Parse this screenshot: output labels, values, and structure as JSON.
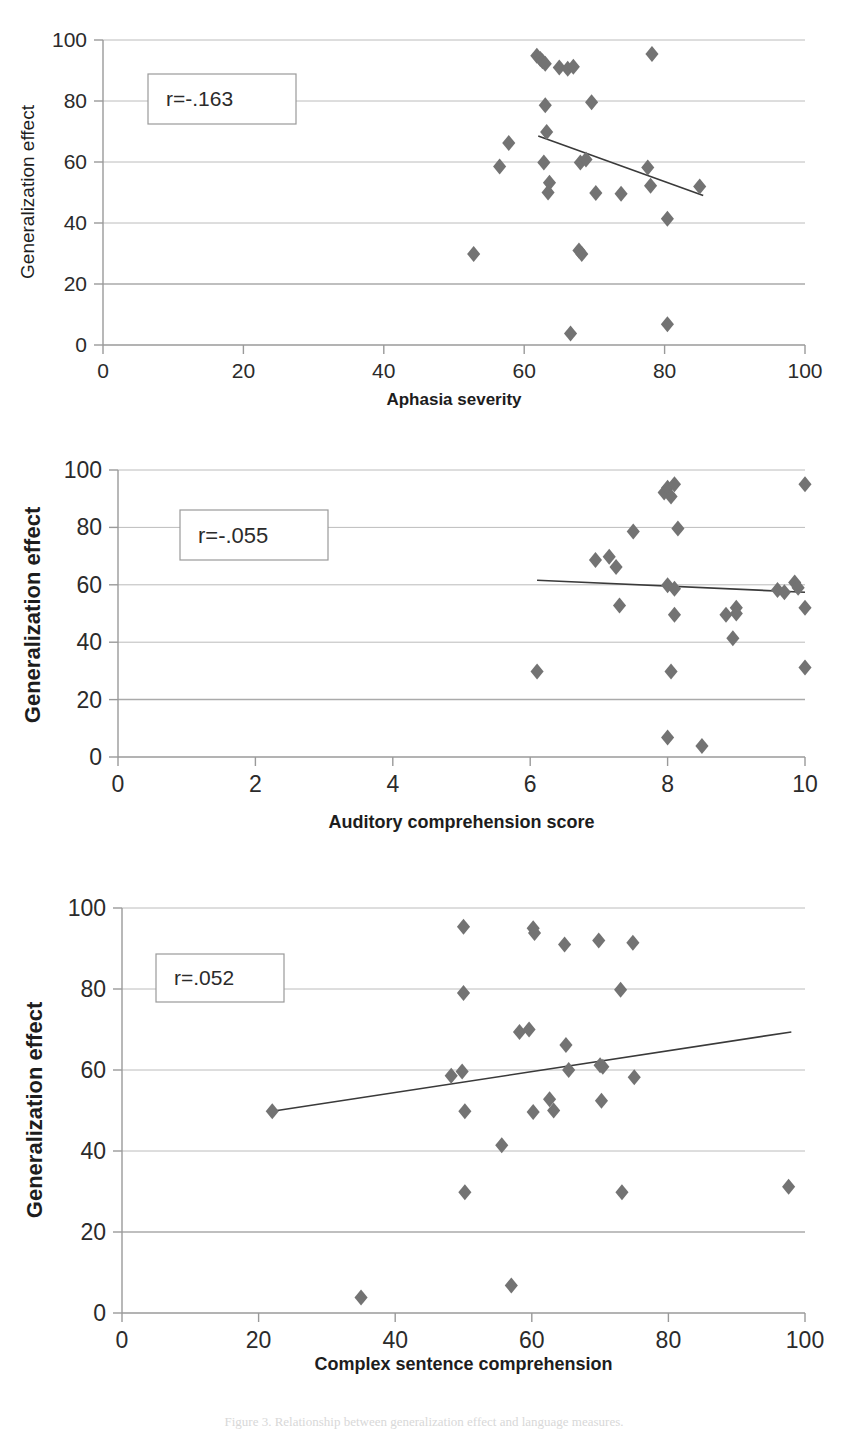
{
  "figure": {
    "caption": "Figure 3.  Relationship between generalization effect and language measures.",
    "marker_color": "#737373",
    "gridline_color": "#a6a6a6",
    "axis_color": "#9a9a9a",
    "trendline_color": "#3a3a3a",
    "text_color": "#2b2b2b"
  },
  "chart_data": [
    {
      "id": "chart-aphasia-severity",
      "type": "scatter",
      "title": "",
      "xlabel": "Aphasia severity",
      "ylabel": "Generalization effect",
      "annotation": "r=-.163",
      "xlim": [
        0,
        100
      ],
      "ylim": [
        0,
        100
      ],
      "xticks": [
        0,
        20,
        40,
        60,
        80,
        100
      ],
      "yticks": [
        0,
        20,
        40,
        60,
        80,
        100
      ],
      "grid": true,
      "legend": "none",
      "trendline": {
        "x0": 62.0,
        "y0": 68.5,
        "x1": 85.5,
        "y1": 49.0
      },
      "points": [
        {
          "x": 52.8,
          "y": 29.8
        },
        {
          "x": 56.5,
          "y": 58.5
        },
        {
          "x": 57.8,
          "y": 66.2
        },
        {
          "x": 61.8,
          "y": 94.8
        },
        {
          "x": 62.3,
          "y": 93.8
        },
        {
          "x": 62.6,
          "y": 93.0
        },
        {
          "x": 62.8,
          "y": 59.8
        },
        {
          "x": 63.0,
          "y": 92.2
        },
        {
          "x": 63.0,
          "y": 78.6
        },
        {
          "x": 63.2,
          "y": 69.8
        },
        {
          "x": 63.6,
          "y": 53.2
        },
        {
          "x": 63.4,
          "y": 50.0
        },
        {
          "x": 65.0,
          "y": 91.0
        },
        {
          "x": 66.2,
          "y": 90.6
        },
        {
          "x": 66.6,
          "y": 3.8
        },
        {
          "x": 67.0,
          "y": 91.2
        },
        {
          "x": 67.8,
          "y": 31.0
        },
        {
          "x": 68.0,
          "y": 59.8
        },
        {
          "x": 68.2,
          "y": 29.8
        },
        {
          "x": 68.8,
          "y": 60.8
        },
        {
          "x": 69.6,
          "y": 79.6
        },
        {
          "x": 70.2,
          "y": 49.8
        },
        {
          "x": 73.8,
          "y": 49.6
        },
        {
          "x": 77.6,
          "y": 58.2
        },
        {
          "x": 78.2,
          "y": 95.4
        },
        {
          "x": 78.0,
          "y": 52.2
        },
        {
          "x": 80.4,
          "y": 41.4
        },
        {
          "x": 80.4,
          "y": 6.8
        },
        {
          "x": 85.0,
          "y": 52.0
        }
      ]
    },
    {
      "id": "chart-auditory-comprehension",
      "type": "scatter",
      "title": "",
      "xlabel": "Auditory comprehension score",
      "ylabel": "Generalization effect",
      "annotation": "r=-.055",
      "xlim": [
        0,
        10
      ],
      "ylim": [
        0,
        100
      ],
      "xticks": [
        0,
        2,
        4,
        6,
        8,
        10
      ],
      "yticks": [
        0,
        20,
        40,
        60,
        80,
        100
      ],
      "grid": true,
      "legend": "none",
      "trendline": {
        "x0": 6.1,
        "y0": 61.6,
        "x1": 10.0,
        "y1": 57.4
      },
      "points": [
        {
          "x": 6.1,
          "y": 29.8
        },
        {
          "x": 6.95,
          "y": 68.6
        },
        {
          "x": 7.15,
          "y": 69.8
        },
        {
          "x": 7.25,
          "y": 66.2
        },
        {
          "x": 7.3,
          "y": 52.8
        },
        {
          "x": 7.5,
          "y": 78.6
        },
        {
          "x": 7.95,
          "y": 92.2
        },
        {
          "x": 8.0,
          "y": 93.8
        },
        {
          "x": 8.05,
          "y": 90.8
        },
        {
          "x": 8.1,
          "y": 95.0
        },
        {
          "x": 8.0,
          "y": 59.8
        },
        {
          "x": 8.1,
          "y": 49.6
        },
        {
          "x": 8.15,
          "y": 79.6
        },
        {
          "x": 8.1,
          "y": 58.6
        },
        {
          "x": 8.05,
          "y": 29.8
        },
        {
          "x": 8.0,
          "y": 6.8
        },
        {
          "x": 8.5,
          "y": 3.8
        },
        {
          "x": 8.85,
          "y": 49.6
        },
        {
          "x": 9.0,
          "y": 52.0
        },
        {
          "x": 9.0,
          "y": 50.0
        },
        {
          "x": 8.95,
          "y": 41.4
        },
        {
          "x": 9.6,
          "y": 58.2
        },
        {
          "x": 9.7,
          "y": 57.4
        },
        {
          "x": 9.85,
          "y": 60.8
        },
        {
          "x": 9.9,
          "y": 59.0
        },
        {
          "x": 10.0,
          "y": 95.0
        },
        {
          "x": 10.0,
          "y": 52.0
        },
        {
          "x": 10.0,
          "y": 31.2
        }
      ]
    },
    {
      "id": "chart-complex-sentence-comprehension",
      "type": "scatter",
      "title": "",
      "xlabel": "Complex sentence comprehension",
      "ylabel": "Generalization effect",
      "annotation": "r=.052",
      "xlim": [
        0,
        100
      ],
      "ylim": [
        0,
        100
      ],
      "xticks": [
        0,
        20,
        40,
        60,
        80,
        100
      ],
      "yticks": [
        0,
        20,
        40,
        60,
        80,
        100
      ],
      "grid": true,
      "legend": "none",
      "trendline": {
        "x0": 22.0,
        "y0": 49.8,
        "x1": 98.0,
        "y1": 69.4
      },
      "points": [
        {
          "x": 22.0,
          "y": 49.8
        },
        {
          "x": 35.0,
          "y": 3.8
        },
        {
          "x": 48.2,
          "y": 58.6
        },
        {
          "x": 49.8,
          "y": 59.6
        },
        {
          "x": 50.0,
          "y": 95.4
        },
        {
          "x": 50.0,
          "y": 79.0
        },
        {
          "x": 50.2,
          "y": 49.8
        },
        {
          "x": 50.2,
          "y": 29.8
        },
        {
          "x": 55.6,
          "y": 41.4
        },
        {
          "x": 57.0,
          "y": 6.8
        },
        {
          "x": 58.2,
          "y": 69.4
        },
        {
          "x": 59.6,
          "y": 70.0
        },
        {
          "x": 60.2,
          "y": 95.0
        },
        {
          "x": 60.4,
          "y": 93.8
        },
        {
          "x": 60.2,
          "y": 49.6
        },
        {
          "x": 62.6,
          "y": 52.8
        },
        {
          "x": 63.2,
          "y": 50.0
        },
        {
          "x": 64.8,
          "y": 91.0
        },
        {
          "x": 65.0,
          "y": 66.2
        },
        {
          "x": 65.4,
          "y": 60.0
        },
        {
          "x": 69.8,
          "y": 92.0
        },
        {
          "x": 70.0,
          "y": 61.2
        },
        {
          "x": 70.4,
          "y": 60.8
        },
        {
          "x": 70.2,
          "y": 52.4
        },
        {
          "x": 73.0,
          "y": 79.8
        },
        {
          "x": 73.2,
          "y": 29.8
        },
        {
          "x": 74.8,
          "y": 91.4
        },
        {
          "x": 75.0,
          "y": 58.2
        },
        {
          "x": 97.6,
          "y": 31.2
        }
      ]
    }
  ]
}
